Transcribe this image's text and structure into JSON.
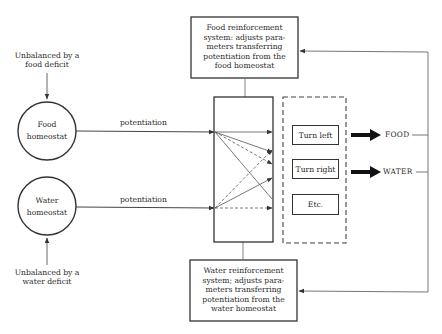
{
  "diagram": {
    "food_deficit_label": [
      "Unbalanced by a",
      "food deficit"
    ],
    "water_deficit_label": [
      "Unbalanced by a",
      "water deficit"
    ],
    "food_homeostat": [
      "Food",
      "homeostat"
    ],
    "water_homeostat": [
      "Water",
      "homeostat"
    ],
    "food_potentiation": "potentiation",
    "water_potentiation": "potentiation",
    "food_reinforcement": [
      "Food reinforcement",
      "system: adjusts para-",
      "meters transferring",
      "potentiation from the",
      "food homeostat"
    ],
    "water_reinforcement": [
      "Water reinforcement",
      "system; adjusts para-",
      "meters transferring",
      "potentiation from the",
      "water homeostat"
    ],
    "responses": [
      {
        "label": "Turn left"
      },
      {
        "label": "Turn right"
      },
      {
        "label": "Etc."
      }
    ],
    "outputs": {
      "food": "FOOD",
      "water": "WATER"
    },
    "colors": {
      "line": "#333333",
      "thin_line": "#777777",
      "background": "#ffffff"
    }
  }
}
